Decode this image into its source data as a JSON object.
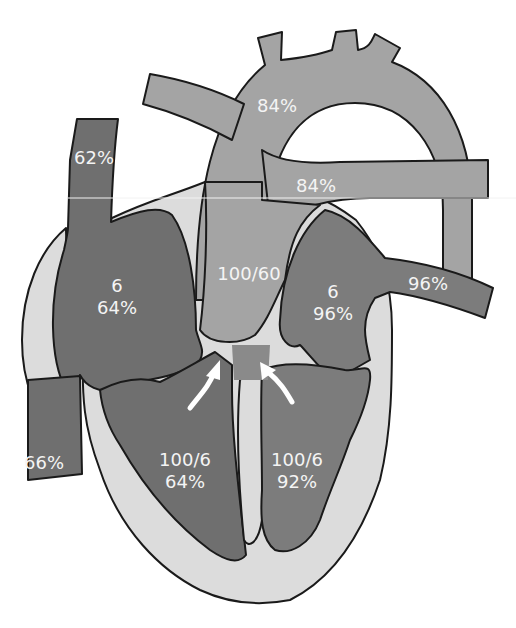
{
  "diagram": {
    "colors": {
      "background": "#ffffff",
      "myocardium": "#dcdcdc",
      "deoxygenated_chamber": "#6f6f6f",
      "great_vessels": "#a4a4a4",
      "oxygenated_chamber": "#7c7c7c",
      "outline": "#1a1a1a",
      "label_text": "#f4f4f4",
      "arrow": "#ffffff"
    },
    "labels": {
      "svc": "62%",
      "ivc": "66%",
      "right_atrium": {
        "pressure": "6",
        "saturation": "64%"
      },
      "right_ventricle": {
        "pressure": "100/6",
        "saturation": "64%"
      },
      "aorta_arch": "84%",
      "pulmonary_artery": "84%",
      "great_artery_root": {
        "pressure": "100/60"
      },
      "left_atrium": {
        "pressure": "6",
        "saturation": "96%"
      },
      "pulmonary_vein": "96%",
      "left_ventricle": {
        "pressure": "100/6",
        "saturation": "92%"
      }
    },
    "arrows": [
      {
        "name": "rv-to-outflow-arrow",
        "direction": "up-right"
      },
      {
        "name": "lv-to-outflow-arrow",
        "direction": "up-left"
      }
    ]
  }
}
